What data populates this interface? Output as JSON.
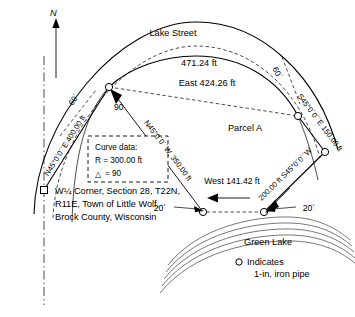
{
  "drawing": {
    "title": "Land survey plat of Parcel A",
    "north_label": "N",
    "street_name": "Lake Street",
    "arc_length": "471.24 ft",
    "chord_bearing_distance": "East 424.26 ft",
    "parcel_label": "Parcel A",
    "lake_label": "Green Lake",
    "central_angle_mark": "90",
    "rw_left": "60´",
    "rw_right": "60´",
    "setback_left": "20´",
    "setback_right": "20´",
    "west_line": "West 141.42 ft",
    "radius_line": "N45°0´0´´W, 350.00 ft",
    "west_boundary": "N45°0´0´´E  400.00 ft",
    "east_boundary_upper": "S45°0´0´´E  150.00 ft",
    "east_boundary_lower": "200.00 ft  S45°0´0´´W"
  },
  "curve_data": {
    "heading": "Curve data:",
    "radius": "R = 300.00 ft",
    "delta": "= 90",
    "delta_symbol": "△"
  },
  "corner_note": {
    "line1": "W¼ Corner, Section 28, T22N,",
    "line2": "R11E, Town of Little Wolf,",
    "line3": "Brock County, Wisconsin"
  },
  "legend": {
    "symbol": "○",
    "line1": "Indicates",
    "line2": "1-in. iron pipe"
  },
  "colors": {
    "ink": "#000000",
    "water": "#555555",
    "paper": "#ffffff"
  }
}
